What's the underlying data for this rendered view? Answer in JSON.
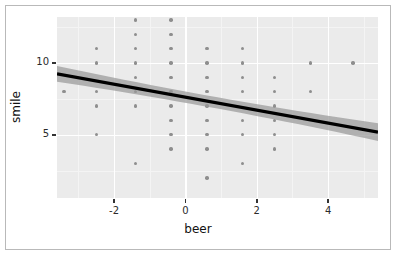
{
  "figure": {
    "background": "#ffffff",
    "border_color": "#b9b9b9",
    "panel_color": "#ebebeb",
    "gridline_color": "#ffffff",
    "point_color": "#8e8e8e",
    "line_color": "#000000",
    "ribbon_color": "#999999"
  },
  "axis": {
    "x_title": "beer",
    "y_title": "smile",
    "x_ticks": [
      "-2",
      "0",
      "2",
      "4"
    ],
    "y_ticks": [
      "10",
      "5"
    ]
  },
  "chart_data": {
    "type": "scatter",
    "title": "",
    "subtitle": "",
    "xlabel": "beer",
    "ylabel": "smile",
    "xlim": [
      -3.6,
      5.4
    ],
    "ylim": [
      0.6,
      13.2
    ],
    "x_ticks": [
      -2,
      0,
      2,
      4
    ],
    "y_ticks": [
      5,
      10
    ],
    "grid": true,
    "grid_major_x": [
      -2,
      0,
      2,
      4
    ],
    "grid_major_y": [
      5,
      10
    ],
    "grid_minor_x": [
      -3,
      -1,
      1,
      3,
      5
    ],
    "grid_minor_y": [
      2.5,
      7.5,
      12.5
    ],
    "legend": "none",
    "points": [
      [
        -3.4,
        8
      ],
      [
        -2.5,
        11
      ],
      [
        -2.5,
        10
      ],
      [
        -2.5,
        8
      ],
      [
        -2.5,
        7
      ],
      [
        -2.5,
        5
      ],
      [
        -1.4,
        13
      ],
      [
        -1.4,
        12
      ],
      [
        -1.4,
        11
      ],
      [
        -1.4,
        10
      ],
      [
        -1.4,
        9
      ],
      [
        -1.4,
        8
      ],
      [
        -1.4,
        7
      ],
      [
        -1.4,
        3
      ],
      [
        -0.4,
        13
      ],
      [
        -0.4,
        12
      ],
      [
        -0.4,
        11
      ],
      [
        -0.4,
        10
      ],
      [
        -0.4,
        9
      ],
      [
        -0.4,
        8
      ],
      [
        -0.4,
        7
      ],
      [
        -0.4,
        6
      ],
      [
        -0.4,
        5
      ],
      [
        -0.4,
        4
      ],
      [
        0.6,
        11
      ],
      [
        0.6,
        10
      ],
      [
        0.6,
        9
      ],
      [
        0.6,
        8
      ],
      [
        0.6,
        7
      ],
      [
        0.6,
        6
      ],
      [
        0.6,
        5
      ],
      [
        0.6,
        4
      ],
      [
        0.6,
        2
      ],
      [
        1.6,
        11
      ],
      [
        1.6,
        10
      ],
      [
        1.6,
        9
      ],
      [
        1.6,
        8
      ],
      [
        1.6,
        6
      ],
      [
        1.6,
        5
      ],
      [
        1.6,
        3
      ],
      [
        2.5,
        9
      ],
      [
        2.5,
        8
      ],
      [
        2.5,
        7
      ],
      [
        2.5,
        6
      ],
      [
        2.5,
        5
      ],
      [
        2.5,
        4
      ],
      [
        3.5,
        10
      ],
      [
        3.5,
        8
      ],
      [
        4.7,
        10
      ]
    ],
    "fit": {
      "type": "linear-regression",
      "intercept": 7.62,
      "slope": -0.45,
      "x_start": -3.6,
      "x_end": 5.4,
      "y_start": 9.24,
      "y_end": 5.19,
      "confidence_band": true,
      "band_halfwidth_start": 0.55,
      "band_halfwidth_middle": 0.2,
      "band_halfwidth_end": 0.62
    }
  }
}
